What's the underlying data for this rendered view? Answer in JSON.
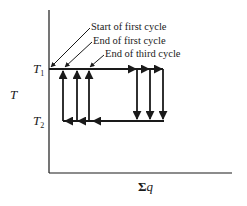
{
  "diagram": {
    "type": "thermal-cycle",
    "y_axis_label": "T",
    "x_axis_label_symbol": "Σ",
    "x_axis_label_var": "q",
    "levels": [
      {
        "name": "T",
        "sub": "1",
        "role": "upper temperature"
      },
      {
        "name": "T",
        "sub": "2",
        "role": "lower temperature"
      }
    ],
    "annotations": [
      {
        "text": "Start of first cycle"
      },
      {
        "text": "End of first cycle"
      },
      {
        "text": "End of third cycle"
      }
    ],
    "cycles": 3,
    "line_color": "#1a1a1a"
  }
}
